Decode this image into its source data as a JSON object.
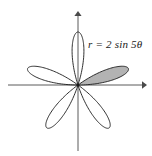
{
  "figure": {
    "label": "r = 2 sin 5θ",
    "background_color": "#ffffff",
    "axis_color": "#5a5a5a",
    "curve_color": "#1a1a1a",
    "shaded_petal_fill": "#b3b3b3",
    "origin": {
      "x": 78,
      "y": 85
    },
    "x_axis": {
      "start_x": 8,
      "end_x": 146,
      "y": 85,
      "arrow": "right"
    },
    "y_axis": {
      "x": 78,
      "start_y": 12,
      "end_y": 151,
      "arrow": "up"
    }
  },
  "chart_data": {
    "type": "line",
    "subtype": "polar-rose",
    "title": "r = 2 sin 5θ",
    "equation": "r = 2 sin 5θ",
    "amplitude": 2,
    "petal_count": 5,
    "k": 5,
    "theta_range_degrees": [
      0,
      360
    ],
    "r_max": 2,
    "xlabel": "",
    "ylabel": "",
    "grid": false,
    "legend": false,
    "petals": [
      {
        "index": 1,
        "center_angle_deg": 18,
        "span_deg": [
          0,
          36
        ],
        "shaded": true,
        "tip_r": 2
      },
      {
        "index": 2,
        "center_angle_deg": 90,
        "span_deg": [
          72,
          108
        ],
        "shaded": false,
        "tip_r": 2
      },
      {
        "index": 3,
        "center_angle_deg": 162,
        "span_deg": [
          144,
          180
        ],
        "shaded": false,
        "tip_r": 2
      },
      {
        "index": 4,
        "center_angle_deg": 234,
        "span_deg": [
          216,
          252
        ],
        "shaded": false,
        "tip_r": 2
      },
      {
        "index": 5,
        "center_angle_deg": 306,
        "span_deg": [
          288,
          324
        ],
        "shaded": false,
        "tip_r": 2
      }
    ],
    "annotations": [
      {
        "text": "r = 2 sin 5θ",
        "x": 88,
        "y": 44
      }
    ]
  }
}
